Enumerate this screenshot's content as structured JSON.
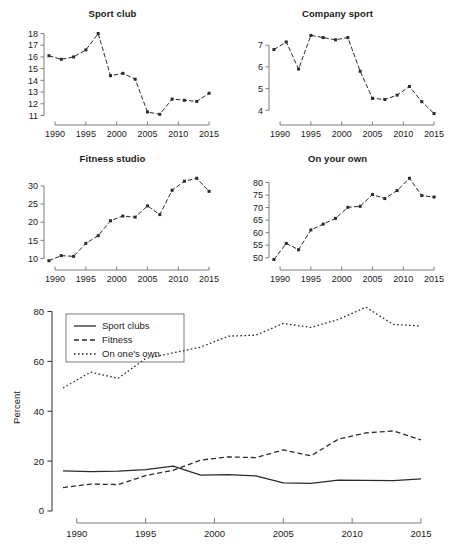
{
  "figure": {
    "panel_count": 5,
    "years": [
      1989,
      1991,
      1993,
      1995,
      1997,
      1999,
      2001,
      2003,
      2005,
      2007,
      2009,
      2011,
      2013,
      2015
    ]
  },
  "chart_data": [
    {
      "type": "line",
      "title": "Sport club",
      "xlabel": "",
      "ylabel": "",
      "x": [
        1989,
        1991,
        1993,
        1995,
        1997,
        1999,
        2001,
        2003,
        2005,
        2007,
        2009,
        2011,
        2013,
        2015
      ],
      "values": [
        16.1,
        15.8,
        16.0,
        16.6,
        18.0,
        14.4,
        14.6,
        14.1,
        11.3,
        11.1,
        12.4,
        12.3,
        12.2,
        12.9
      ],
      "xticks": [
        1990,
        1995,
        2000,
        2005,
        2010,
        2015
      ],
      "yticks": [
        11,
        12,
        13,
        14,
        15,
        16,
        17,
        18
      ],
      "xlim": [
        1988.2,
        2015.8
      ],
      "ylim": [
        10.7,
        18.3
      ],
      "grid": false,
      "linestyle": "dashed-with-markers",
      "marker": "square"
    },
    {
      "type": "line",
      "title": "Company sport",
      "xlabel": "",
      "ylabel": "",
      "x": [
        1989,
        1991,
        1993,
        1995,
        1997,
        1999,
        2001,
        2003,
        2005,
        2007,
        2009,
        2011,
        2013,
        2015
      ],
      "values": [
        6.8,
        7.15,
        5.9,
        7.45,
        7.35,
        7.25,
        7.35,
        5.8,
        4.55,
        4.5,
        4.7,
        5.1,
        4.4,
        3.85
      ],
      "xticks": [
        1990,
        1995,
        2000,
        2005,
        2010,
        2015
      ],
      "yticks": [
        4,
        5,
        6,
        7
      ],
      "xlim": [
        1988.2,
        2015.8
      ],
      "ylim": [
        3.6,
        7.7
      ],
      "grid": false,
      "linestyle": "dashed-with-markers",
      "marker": "square"
    },
    {
      "type": "line",
      "title": "Fitness studio",
      "xlabel": "",
      "ylabel": "",
      "x": [
        1989,
        1991,
        1993,
        1995,
        1997,
        1999,
        2001,
        2003,
        2005,
        2007,
        2009,
        2011,
        2013,
        2015
      ],
      "values": [
        9.4,
        10.8,
        10.6,
        14.2,
        16.3,
        20.4,
        21.7,
        21.4,
        24.5,
        22.1,
        28.8,
        31.3,
        32.1,
        28.5
      ],
      "xticks": [
        1990,
        1995,
        2000,
        2005,
        2010,
        2015
      ],
      "yticks": [
        10,
        15,
        20,
        25,
        30
      ],
      "xlim": [
        1988.2,
        2015.8
      ],
      "ylim": [
        8.5,
        33.0
      ],
      "grid": false,
      "linestyle": "dashed-with-markers",
      "marker": "square"
    },
    {
      "type": "line",
      "title": "On your own",
      "xlabel": "",
      "ylabel": "",
      "x": [
        1989,
        1991,
        1993,
        1995,
        1997,
        1999,
        2001,
        2003,
        2005,
        2007,
        2009,
        2011,
        2013,
        2015
      ],
      "values": [
        49.3,
        55.7,
        53.2,
        61.1,
        63.4,
        65.7,
        70.1,
        70.5,
        75.2,
        73.6,
        76.8,
        81.7,
        74.8,
        74.2
      ],
      "xticks": [
        1990,
        1995,
        2000,
        2005,
        2010,
        2015
      ],
      "yticks": [
        50,
        55,
        60,
        65,
        70,
        75,
        80
      ],
      "xlim": [
        1988.2,
        2015.8
      ],
      "ylim": [
        47.5,
        83.0
      ],
      "grid": false,
      "linestyle": "dashed-with-markers",
      "marker": "square"
    },
    {
      "type": "line",
      "title": "",
      "xlabel": "",
      "ylabel": "Percent",
      "x": [
        1989,
        1991,
        1993,
        1995,
        1997,
        1999,
        2001,
        2003,
        2005,
        2007,
        2009,
        2011,
        2013,
        2015
      ],
      "series": [
        {
          "name": "Sport clubs",
          "linestyle": "solid",
          "values": [
            16.1,
            15.8,
            16.0,
            16.6,
            18.0,
            14.4,
            14.6,
            14.1,
            11.3,
            11.1,
            12.4,
            12.3,
            12.2,
            12.9
          ]
        },
        {
          "name": "Fitness",
          "linestyle": "dashed",
          "values": [
            9.4,
            10.8,
            10.6,
            14.2,
            16.3,
            20.4,
            21.7,
            21.4,
            24.5,
            22.1,
            28.8,
            31.3,
            32.1,
            28.5
          ]
        },
        {
          "name": "On one's own",
          "linestyle": "dotted",
          "values": [
            49.3,
            55.7,
            53.2,
            61.1,
            63.4,
            65.7,
            70.1,
            70.5,
            75.2,
            73.6,
            76.8,
            81.7,
            74.8,
            74.2
          ]
        }
      ],
      "xticks": [
        1990,
        1995,
        2000,
        2005,
        2010,
        2015
      ],
      "yticks": [
        0,
        20,
        40,
        60,
        80
      ],
      "xlim": [
        1988.2,
        2015.8
      ],
      "ylim": [
        0,
        83
      ],
      "grid": false,
      "legend_position": "top-left"
    }
  ]
}
